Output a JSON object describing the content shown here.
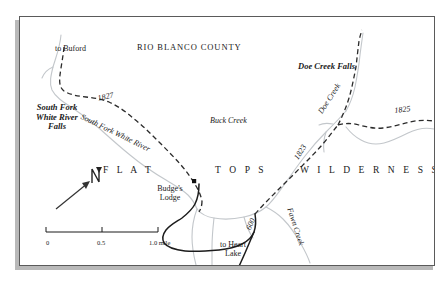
{
  "map": {
    "title": "RIO BLANCO COUNTY",
    "wilderness_words": [
      "F L A T",
      "T O P S",
      "W I L D E R N E S S"
    ],
    "labels": {
      "to_buford": "to Buford",
      "south_fork_falls_line1": "South Fork",
      "south_fork_falls_line2": "White River",
      "south_fork_falls_line3": "Falls",
      "south_fork_river": "South Fork White River",
      "buck_creek": "Buck Creek",
      "doe_creek_falls": "Doe Creek Falls",
      "doe_creek": "Doe Creek",
      "fawn_creek": "Fawn Creek",
      "budges_lodge_line1": "Budge's",
      "budges_lodge_line2": "Lodge",
      "to_heart_lake_line1": "to Heart",
      "to_heart_lake_line2": "Lake"
    },
    "road_numbers": {
      "road_1827": "1827",
      "road_1825": "1825",
      "road_1823": "1823",
      "road_600": "600"
    },
    "scale_bar": {
      "tick_0": "0",
      "tick_half": "0.5",
      "tick_one": "1.0 mile"
    },
    "compass": {
      "north_letter": "N"
    },
    "colors": {
      "stream": "#c3c7cb",
      "road_dashed": "#2b2b2b",
      "road_solid": "#1c1c1c",
      "border": "#5a5a5a",
      "shadow": "#b9b9b9",
      "text": "#1a1a1a"
    }
  }
}
